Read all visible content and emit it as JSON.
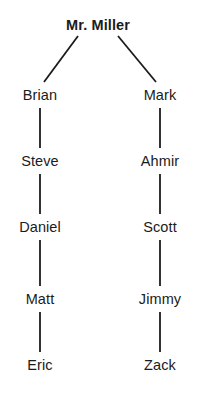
{
  "diagram": {
    "type": "tree",
    "background_color": "#ffffff",
    "line_color": "#1b1b1b",
    "text_color": "#1b1b1b",
    "nodes": [
      {
        "id": "root",
        "label": "Mr. Miller",
        "x": 98,
        "y": 25,
        "bold": true
      },
      {
        "id": "l1",
        "label": "Brian",
        "x": 40,
        "y": 95,
        "bold": false
      },
      {
        "id": "l2",
        "label": "Steve",
        "x": 40,
        "y": 161,
        "bold": false
      },
      {
        "id": "l3",
        "label": "Daniel",
        "x": 40,
        "y": 227,
        "bold": false
      },
      {
        "id": "l4",
        "label": "Matt",
        "x": 40,
        "y": 299,
        "bold": false
      },
      {
        "id": "l5",
        "label": "Eric",
        "x": 40,
        "y": 365,
        "bold": false
      },
      {
        "id": "r1",
        "label": "Mark",
        "x": 160,
        "y": 95,
        "bold": false
      },
      {
        "id": "r2",
        "label": "Ahmir",
        "x": 160,
        "y": 161,
        "bold": false
      },
      {
        "id": "r3",
        "label": "Scott",
        "x": 160,
        "y": 227,
        "bold": false
      },
      {
        "id": "r4",
        "label": "Jimmy",
        "x": 160,
        "y": 299,
        "bold": false
      },
      {
        "id": "r5",
        "label": "Zack",
        "x": 160,
        "y": 365,
        "bold": false
      }
    ],
    "edges": [
      {
        "from": "root",
        "to": "l1",
        "x1": 78,
        "y1": 36,
        "x2": 44,
        "y2": 82,
        "style": "diagonal"
      },
      {
        "from": "root",
        "to": "r1",
        "x1": 118,
        "y1": 36,
        "x2": 156,
        "y2": 82,
        "style": "diagonal"
      },
      {
        "from": "l1",
        "to": "l2",
        "x1": 40,
        "y1": 108,
        "x2": 40,
        "y2": 148,
        "style": "vertical"
      },
      {
        "from": "l2",
        "to": "l3",
        "x1": 40,
        "y1": 174,
        "x2": 40,
        "y2": 214,
        "style": "vertical"
      },
      {
        "from": "l3",
        "to": "l4",
        "x1": 40,
        "y1": 240,
        "x2": 40,
        "y2": 286,
        "style": "vertical"
      },
      {
        "from": "l4",
        "to": "l5",
        "x1": 40,
        "y1": 312,
        "x2": 40,
        "y2": 352,
        "style": "vertical"
      },
      {
        "from": "r1",
        "to": "r2",
        "x1": 160,
        "y1": 108,
        "x2": 160,
        "y2": 148,
        "style": "vertical"
      },
      {
        "from": "r2",
        "to": "r3",
        "x1": 160,
        "y1": 174,
        "x2": 160,
        "y2": 214,
        "style": "vertical"
      },
      {
        "from": "r3",
        "to": "r4",
        "x1": 160,
        "y1": 240,
        "x2": 160,
        "y2": 286,
        "style": "vertical"
      },
      {
        "from": "r4",
        "to": "r5",
        "x1": 160,
        "y1": 312,
        "x2": 160,
        "y2": 352,
        "style": "vertical"
      }
    ]
  }
}
